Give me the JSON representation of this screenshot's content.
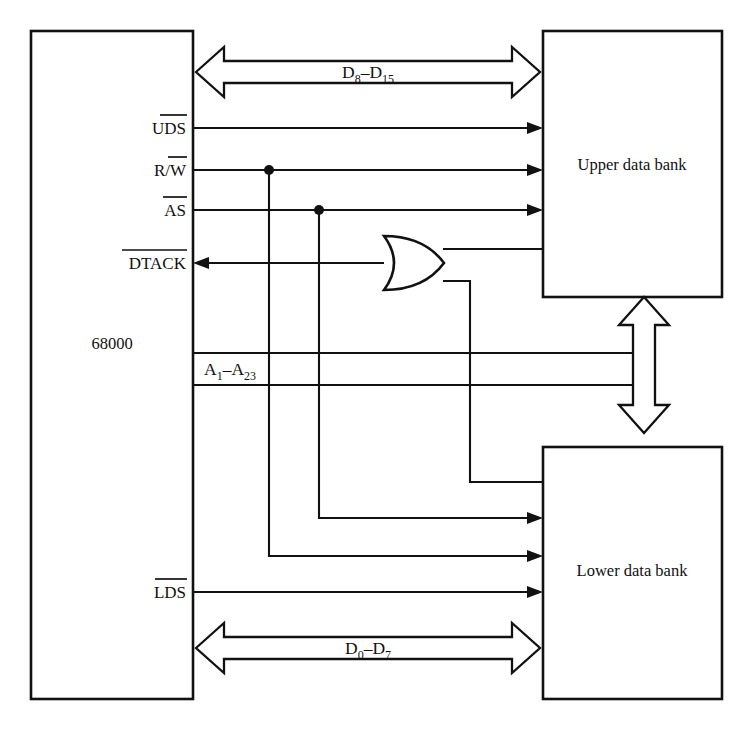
{
  "diagram": {
    "blocks": [
      {
        "id": "cpu",
        "label": "68000"
      },
      {
        "id": "upper",
        "label": "Upper data bank"
      },
      {
        "id": "lower",
        "label": "Lower data bank"
      }
    ],
    "buses": [
      {
        "id": "d-high",
        "label_main": "D",
        "label_sub1": "8",
        "label_dash": "–D",
        "label_sub2": "15",
        "text": "D8–D15",
        "direction": "bidirectional"
      },
      {
        "id": "d-low",
        "label_main": "D",
        "label_sub1": "0",
        "label_dash": "–D",
        "label_sub2": "7",
        "text": "D0–D7",
        "direction": "bidirectional"
      },
      {
        "id": "addr",
        "label_main": "A",
        "label_sub1": "1",
        "label_dash": "–A",
        "label_sub2": "23",
        "text": "A1–A23",
        "direction": "bidirectional-vertical"
      }
    ],
    "signals": [
      {
        "id": "uds",
        "text": "UDS",
        "overbar": "full",
        "direction": "out"
      },
      {
        "id": "rw",
        "text": "R/W",
        "overbar": "w-only",
        "direction": "out"
      },
      {
        "id": "as",
        "text": "AS",
        "overbar": "full",
        "direction": "out"
      },
      {
        "id": "dtack",
        "text": "DTACK",
        "overbar": "full",
        "direction": "in"
      },
      {
        "id": "lds",
        "text": "LDS",
        "overbar": "full",
        "direction": "out"
      }
    ],
    "gates": [
      {
        "id": "or1",
        "type": "OR",
        "inputs": 2,
        "label": ""
      }
    ],
    "colors": {
      "line": "#111111",
      "fill": "#ffffff",
      "background": "#ffffff"
    }
  }
}
